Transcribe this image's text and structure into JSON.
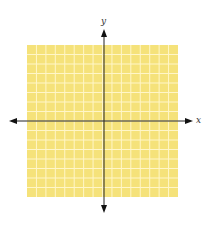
{
  "diagram": {
    "type": "coordinate-plane",
    "axes": {
      "x_label": "x",
      "y_label": "y"
    },
    "grid": {
      "columns": 16,
      "rows": 16,
      "fill_color": "#F5E27A",
      "line_color": "#FFF6C8",
      "axis_color": "#222222"
    }
  }
}
